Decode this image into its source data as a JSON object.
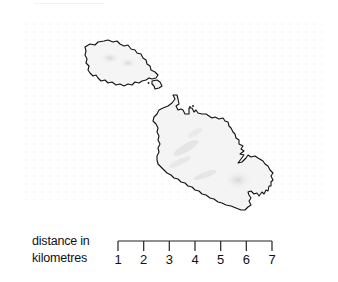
{
  "map": {
    "region": "Maltese Islands",
    "islands": [
      {
        "name": "Gozo"
      },
      {
        "name": "Comino"
      },
      {
        "name": "Malta"
      }
    ],
    "colors": {
      "coastline": "#111111",
      "land": "#f3f3f3",
      "relief": "#d9d9d9",
      "background": "#ffffff"
    }
  },
  "scale": {
    "label_line1": "distance in",
    "label_line2": "kilometres",
    "ticks": [
      "1",
      "2",
      "3",
      "4",
      "5",
      "6",
      "7"
    ],
    "unit": "km"
  }
}
